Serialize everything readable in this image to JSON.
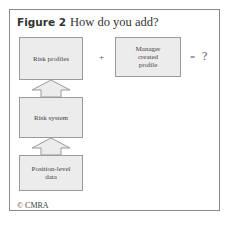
{
  "figure": {
    "label": "Figure 2",
    "title": "How do you add?"
  },
  "boxes": {
    "risk_profiles": "Risk profiles",
    "manager_profile": [
      "Manager",
      "created",
      "profile"
    ],
    "risk_system": "Risk system",
    "position_data": [
      "Position-level",
      "data"
    ]
  },
  "operators": {
    "plus": "+",
    "equals": "=",
    "result": "?"
  },
  "credit": "© CMRA",
  "colors": {
    "box_fill": "#ececec",
    "box_border": "#9a9a9a",
    "frame_border": "#8a8a8a"
  }
}
